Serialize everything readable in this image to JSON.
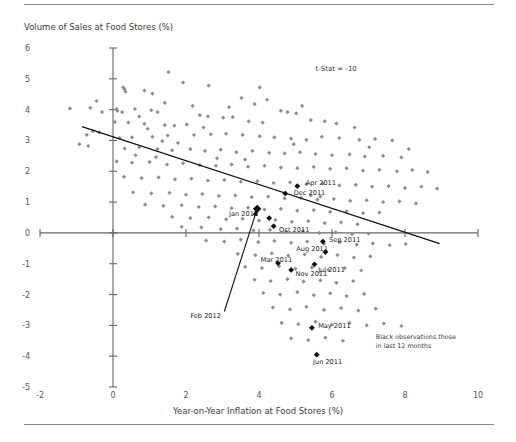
{
  "chart_data": {
    "type": "scatter",
    "title": "",
    "ylabel": "Volume of Sales at Food Stores (%)",
    "xlabel": "Year-on-Year Inflation at Food Stores (%)",
    "xlim": [
      -2,
      10
    ],
    "ylim": [
      -5,
      6
    ],
    "xticks": [
      "-2",
      "0",
      "2",
      "4",
      "6",
      "8",
      "10"
    ],
    "xtick_values": [
      -2,
      0,
      2,
      4,
      6,
      8,
      10
    ],
    "yticks": [
      "6",
      "5",
      "4",
      "3",
      "2",
      "1",
      "0",
      "-1",
      "-2",
      "-3",
      "-4",
      "-5"
    ],
    "ytick_values": [
      6,
      5,
      4,
      3,
      2,
      1,
      0,
      -1,
      -2,
      -3,
      -4,
      -5
    ],
    "grid": false,
    "legend_position": "none",
    "annotations": [
      {
        "name": "t-stat",
        "text": "t-Stat = -10",
        "x": 5.55,
        "y": 5.35
      },
      {
        "name": "black-note-line1",
        "text": "Black observations those",
        "x": 7.2,
        "y": -3.35
      },
      {
        "name": "black-note-line2",
        "text": "in last 12 months",
        "x": 7.2,
        "y": -3.65
      }
    ],
    "trendline": {
      "name": "regression-line",
      "x1": -0.85,
      "y1": 3.45,
      "x2": 8.95,
      "y2": -0.35,
      "color": "#111111"
    },
    "arrow": {
      "name": "feb-2012-arrow",
      "x1": 3.05,
      "y1": -2.55,
      "x2": 3.95,
      "y2": 0.78,
      "color": "#111111"
    },
    "series": [
      {
        "name": "Historic observations",
        "color": "#8d8d8d",
        "marker": "diamond",
        "points": [
          [
            1.52,
            5.22
          ],
          [
            1.92,
            4.88
          ],
          [
            2.62,
            4.78
          ],
          [
            0.28,
            4.72
          ],
          [
            0.32,
            4.66
          ],
          [
            0.34,
            4.58
          ],
          [
            0.86,
            4.62
          ],
          [
            1.08,
            4.52
          ],
          [
            -0.45,
            4.28
          ],
          [
            4.02,
            4.72
          ],
          [
            3.52,
            4.38
          ],
          [
            4.22,
            4.32
          ],
          [
            3.88,
            4.18
          ],
          [
            0.1,
            4.02
          ],
          [
            0.12,
            3.96
          ],
          [
            0.25,
            3.92
          ],
          [
            -1.18,
            4.04
          ],
          [
            -0.62,
            4.06
          ],
          [
            -0.3,
            3.92
          ],
          [
            0.6,
            4.02
          ],
          [
            1.05,
            3.98
          ],
          [
            1.22,
            3.92
          ],
          [
            4.6,
            3.96
          ],
          [
            4.78,
            3.92
          ],
          [
            5.02,
            3.88
          ],
          [
            2.38,
            3.82
          ],
          [
            2.6,
            3.78
          ],
          [
            3.02,
            3.74
          ],
          [
            3.28,
            3.76
          ],
          [
            0.05,
            3.6
          ],
          [
            0.42,
            3.58
          ],
          [
            0.86,
            3.54
          ],
          [
            1.42,
            3.5
          ],
          [
            1.68,
            3.48
          ],
          [
            2.02,
            3.52
          ],
          [
            3.72,
            3.62
          ],
          [
            4.1,
            3.58
          ],
          [
            5.42,
            3.66
          ],
          [
            5.8,
            3.62
          ],
          [
            6.12,
            3.55
          ],
          [
            -0.55,
            3.3
          ],
          [
            -0.38,
            3.26
          ],
          [
            -0.72,
            3.18
          ],
          [
            0.18,
            3.08
          ],
          [
            0.52,
            3.1
          ],
          [
            1.08,
            3.12
          ],
          [
            1.5,
            3.16
          ],
          [
            2.22,
            3.18
          ],
          [
            2.68,
            3.2
          ],
          [
            3.1,
            3.22
          ],
          [
            3.55,
            3.18
          ],
          [
            4.02,
            3.14
          ],
          [
            4.42,
            3.1
          ],
          [
            4.88,
            3.06
          ],
          [
            5.3,
            3.02
          ],
          [
            5.72,
            3.12
          ],
          [
            6.2,
            3.08
          ],
          [
            6.75,
            3.02
          ],
          [
            7.18,
            3.05
          ],
          [
            7.65,
            3.0
          ],
          [
            -0.92,
            2.88
          ],
          [
            -0.68,
            2.82
          ],
          [
            0.32,
            2.74
          ],
          [
            0.72,
            2.78
          ],
          [
            1.22,
            2.72
          ],
          [
            1.62,
            2.68
          ],
          [
            2.12,
            2.72
          ],
          [
            2.52,
            2.66
          ],
          [
            2.95,
            2.7
          ],
          [
            3.38,
            2.62
          ],
          [
            3.82,
            2.66
          ],
          [
            4.28,
            2.6
          ],
          [
            4.7,
            2.58
          ],
          [
            5.12,
            2.62
          ],
          [
            5.55,
            2.56
          ],
          [
            6.0,
            2.52
          ],
          [
            6.48,
            2.55
          ],
          [
            6.9,
            2.48
          ],
          [
            7.4,
            2.5
          ],
          [
            7.9,
            2.45
          ],
          [
            0.1,
            2.32
          ],
          [
            0.52,
            2.28
          ],
          [
            1.0,
            2.3
          ],
          [
            1.48,
            2.22
          ],
          [
            1.92,
            2.26
          ],
          [
            2.38,
            2.2
          ],
          [
            2.82,
            2.18
          ],
          [
            3.25,
            2.22
          ],
          [
            3.7,
            2.15
          ],
          [
            4.15,
            2.18
          ],
          [
            4.6,
            2.12
          ],
          [
            5.05,
            2.1
          ],
          [
            5.5,
            2.14
          ],
          [
            5.95,
            2.08
          ],
          [
            6.4,
            2.1
          ],
          [
            6.85,
            2.02
          ],
          [
            7.3,
            2.05
          ],
          [
            7.78,
            2.0
          ],
          [
            8.2,
            2.04
          ],
          [
            8.62,
            1.98
          ],
          [
            0.3,
            1.82
          ],
          [
            0.78,
            1.78
          ],
          [
            1.25,
            1.8
          ],
          [
            1.7,
            1.74
          ],
          [
            2.15,
            1.76
          ],
          [
            2.6,
            1.7
          ],
          [
            3.05,
            1.72
          ],
          [
            3.5,
            1.66
          ],
          [
            3.95,
            1.68
          ],
          [
            4.4,
            1.62
          ],
          [
            4.85,
            1.64
          ],
          [
            5.3,
            1.58
          ],
          [
            5.75,
            1.6
          ],
          [
            6.2,
            1.54
          ],
          [
            6.65,
            1.56
          ],
          [
            7.1,
            1.5
          ],
          [
            7.55,
            1.52
          ],
          [
            8.0,
            1.46
          ],
          [
            8.45,
            1.5
          ],
          [
            8.88,
            1.44
          ],
          [
            0.55,
            1.32
          ],
          [
            1.05,
            1.28
          ],
          [
            1.55,
            1.3
          ],
          [
            2.0,
            1.24
          ],
          [
            2.45,
            1.26
          ],
          [
            2.9,
            1.2
          ],
          [
            3.35,
            1.22
          ],
          [
            3.8,
            1.16
          ],
          [
            4.25,
            1.18
          ],
          [
            4.7,
            1.12
          ],
          [
            5.15,
            1.14
          ],
          [
            5.6,
            1.08
          ],
          [
            6.05,
            1.1
          ],
          [
            6.5,
            1.04
          ],
          [
            6.95,
            1.06
          ],
          [
            7.4,
            1.0
          ],
          [
            7.85,
            1.02
          ],
          [
            8.3,
            0.96
          ],
          [
            5.42,
            1.22
          ],
          [
            5.68,
            1.18
          ],
          [
            0.88,
            0.92
          ],
          [
            1.38,
            0.88
          ],
          [
            1.88,
            0.9
          ],
          [
            2.35,
            0.84
          ],
          [
            2.8,
            0.86
          ],
          [
            3.25,
            0.8
          ],
          [
            3.7,
            0.82
          ],
          [
            4.15,
            0.76
          ],
          [
            4.6,
            0.78
          ],
          [
            5.05,
            0.72
          ],
          [
            5.5,
            0.74
          ],
          [
            5.95,
            0.68
          ],
          [
            6.4,
            0.7
          ],
          [
            6.85,
            0.64
          ],
          [
            7.3,
            0.66
          ],
          [
            1.62,
            0.52
          ],
          [
            2.12,
            0.48
          ],
          [
            2.62,
            0.5
          ],
          [
            3.1,
            0.44
          ],
          [
            3.55,
            0.46
          ],
          [
            4.0,
            0.4
          ],
          [
            4.45,
            0.42
          ],
          [
            4.9,
            0.36
          ],
          [
            5.35,
            0.38
          ],
          [
            5.8,
            0.32
          ],
          [
            6.25,
            0.34
          ],
          [
            6.7,
            0.28
          ],
          [
            2.95,
            0.12
          ],
          [
            3.4,
            0.14
          ],
          [
            3.85,
            0.08
          ],
          [
            4.3,
            0.1
          ],
          [
            4.75,
            0.04
          ],
          [
            5.2,
            0.06
          ],
          [
            5.65,
            0.0
          ],
          [
            6.1,
            0.02
          ],
          [
            6.55,
            -0.04
          ],
          [
            7.0,
            -0.02
          ],
          [
            1.88,
            0.2
          ],
          [
            2.42,
            0.18
          ],
          [
            2.55,
            -0.25
          ],
          [
            3.05,
            -0.28
          ],
          [
            3.5,
            -0.22
          ],
          [
            3.98,
            -0.3
          ],
          [
            4.42,
            -0.26
          ],
          [
            4.88,
            -0.32
          ],
          [
            5.32,
            -0.28
          ],
          [
            5.78,
            -0.35
          ],
          [
            6.22,
            -0.3
          ],
          [
            6.68,
            -0.38
          ],
          [
            7.12,
            -0.34
          ],
          [
            7.58,
            -0.4
          ],
          [
            8.02,
            -0.36
          ],
          [
            3.42,
            -0.68
          ],
          [
            3.9,
            -0.72
          ],
          [
            4.35,
            -0.66
          ],
          [
            4.8,
            -0.74
          ],
          [
            5.25,
            -0.7
          ],
          [
            5.7,
            -0.78
          ],
          [
            6.15,
            -0.72
          ],
          [
            6.6,
            -0.8
          ],
          [
            7.05,
            -0.76
          ],
          [
            3.62,
            -1.1
          ],
          [
            4.08,
            -1.14
          ],
          [
            4.55,
            -1.08
          ],
          [
            5.0,
            -1.16
          ],
          [
            5.45,
            -1.12
          ],
          [
            5.9,
            -1.2
          ],
          [
            6.35,
            -1.14
          ],
          [
            6.8,
            -1.22
          ],
          [
            3.88,
            -1.52
          ],
          [
            4.32,
            -1.56
          ],
          [
            4.78,
            -1.5
          ],
          [
            5.22,
            -1.58
          ],
          [
            5.68,
            -1.54
          ],
          [
            6.12,
            -1.62
          ],
          [
            6.58,
            -1.56
          ],
          [
            4.12,
            -1.95
          ],
          [
            4.58,
            -2.0
          ],
          [
            5.05,
            -1.92
          ],
          [
            5.5,
            -2.02
          ],
          [
            5.95,
            -1.96
          ],
          [
            6.4,
            -2.05
          ],
          [
            6.88,
            -1.98
          ],
          [
            4.38,
            -2.42
          ],
          [
            4.85,
            -2.48
          ],
          [
            5.3,
            -2.4
          ],
          [
            5.78,
            -2.5
          ],
          [
            6.25,
            -2.44
          ],
          [
            6.72,
            -2.52
          ],
          [
            7.2,
            -2.46
          ],
          [
            4.62,
            -2.92
          ],
          [
            5.08,
            -2.96
          ],
          [
            5.55,
            -2.88
          ],
          [
            6.0,
            -2.98
          ],
          [
            6.48,
            -2.92
          ],
          [
            6.95,
            -3.0
          ],
          [
            7.42,
            -2.94
          ],
          [
            7.9,
            -3.02
          ],
          [
            4.88,
            -3.42
          ],
          [
            5.35,
            -3.48
          ],
          [
            5.82,
            -3.4
          ],
          [
            6.3,
            -3.5
          ],
          [
            1.35,
            2.98
          ],
          [
            1.78,
            2.92
          ],
          [
            0.95,
            3.38
          ],
          [
            2.48,
            3.42
          ],
          [
            6.62,
            3.42
          ],
          [
            5.18,
            4.12
          ],
          [
            2.18,
            4.12
          ],
          [
            1.42,
            4.22
          ],
          [
            3.18,
            4.08
          ],
          [
            0.72,
            3.78
          ],
          [
            4.95,
            2.88
          ],
          [
            7.02,
            2.78
          ],
          [
            8.1,
            2.72
          ],
          [
            2.85,
            2.42
          ],
          [
            3.62,
            2.38
          ],
          [
            0.62,
            2.52
          ],
          [
            1.18,
            2.46
          ]
        ]
      },
      {
        "name": "Last 12 months (black)",
        "color": "#111111",
        "marker": "diamond-filled",
        "points": [
          {
            "label": "Feb 2012",
            "x": 3.95,
            "y": 0.78,
            "label_x": 2.12,
            "label_y": -2.68,
            "big": true
          },
          {
            "label": "Jan 2012",
            "x": 4.28,
            "y": 0.48,
            "label_x": 3.18,
            "label_y": 0.62,
            "big": false
          },
          {
            "label": "Apr 2011",
            "x": 5.05,
            "y": 1.52,
            "label_x": 5.28,
            "label_y": 1.62,
            "big": false
          },
          {
            "label": "Dec 2011",
            "x": 4.72,
            "y": 1.28,
            "label_x": 4.95,
            "label_y": 1.3,
            "big": false
          },
          {
            "label": "Oct 2011",
            "x": 4.4,
            "y": 0.22,
            "label_x": 4.55,
            "label_y": 0.1,
            "big": false
          },
          {
            "label": "Sep 2011",
            "x": 5.75,
            "y": -0.28,
            "label_x": 5.92,
            "label_y": -0.22,
            "big": false
          },
          {
            "label": "Aug 2011",
            "x": 5.82,
            "y": -0.62,
            "label_x": 5.02,
            "label_y": -0.52,
            "big": false
          },
          {
            "label": "Jul 2011",
            "x": 5.52,
            "y": -1.02,
            "label_x": 5.62,
            "label_y": -1.2,
            "big": false
          },
          {
            "label": "Mar 2011",
            "x": 4.52,
            "y": -0.98,
            "label_x": 4.05,
            "label_y": -0.85,
            "big": false
          },
          {
            "label": "Nov 2011",
            "x": 4.88,
            "y": -1.2,
            "label_x": 5.0,
            "label_y": -1.32,
            "big": false
          },
          {
            "label": "May 2011",
            "x": 5.45,
            "y": -3.08,
            "label_x": 5.62,
            "label_y": -3.02,
            "big": false
          },
          {
            "label": "Jun 2011",
            "x": 5.58,
            "y": -3.95,
            "label_x": 5.48,
            "label_y": -4.18,
            "big": false
          }
        ]
      }
    ]
  }
}
